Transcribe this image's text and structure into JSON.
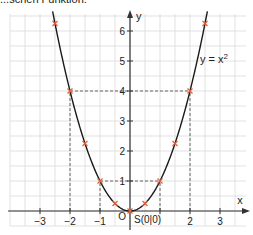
{
  "caption": "...schen Funktion.",
  "chart_data": {
    "type": "line",
    "title": "",
    "function_label": "y = x²",
    "xlabel": "x",
    "ylabel": "y",
    "xlim": [
      -3.5,
      3.9
    ],
    "ylim": [
      -0.7,
      6.6
    ],
    "grid": true,
    "grid_step": 0.5,
    "x_ticks": [
      -3,
      -2,
      -1,
      1,
      2,
      3
    ],
    "x_tick_labels": [
      "−3",
      "−2",
      "−1",
      "",
      "2",
      "3"
    ],
    "y_ticks": [
      1,
      2,
      3,
      4,
      5,
      6
    ],
    "y_tick_labels": [
      "1",
      "2",
      "3",
      "4",
      "5",
      "6"
    ],
    "origin_label": "O",
    "vertex_label": "S(0|0)",
    "series": [
      {
        "name": "y = x²",
        "x": [
          -2.5,
          -2,
          -1.5,
          -1,
          -0.5,
          0,
          0.5,
          1,
          1.5,
          2,
          2.5
        ],
        "y": [
          6.25,
          4,
          2.25,
          1,
          0.25,
          0,
          0.25,
          1,
          2.25,
          4,
          6.25
        ]
      }
    ],
    "guide_lines": [
      {
        "type": "horizontal",
        "y": 4,
        "from_x": -2,
        "to_x": 2,
        "style": "dashed"
      },
      {
        "type": "horizontal",
        "y": 1,
        "from_x": -1,
        "to_x": 1,
        "style": "dashed"
      },
      {
        "type": "vertical",
        "x": -2,
        "from_y": 0,
        "to_y": 4,
        "style": "dashed"
      },
      {
        "type": "vertical",
        "x": 2,
        "from_y": 0,
        "to_y": 4,
        "style": "dashed"
      },
      {
        "type": "vertical",
        "x": -1,
        "from_y": 0,
        "to_y": 1,
        "style": "dashed"
      },
      {
        "type": "vertical",
        "x": 1,
        "from_y": 0,
        "to_y": 1,
        "style": "dashed"
      }
    ],
    "colors": {
      "curve": "#1a1a1a",
      "markers": "#e2603c",
      "grid": "#d9d9d9",
      "axes": "#333333"
    }
  }
}
